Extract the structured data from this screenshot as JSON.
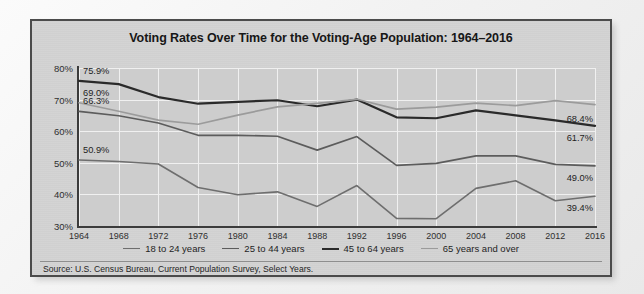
{
  "card": {
    "title": "Voting Rates Over Time for the Voting-Age Population: 1964–2016",
    "source": "Source: U.S. Census Bureau, Current Population Survey, Select Years.",
    "border_color": "#4b4b4b",
    "background_color": "#d2d2d2",
    "plot_background_color": "#cdcdcd",
    "gridline_color": "#f0f0f0"
  },
  "chart_data": {
    "type": "line",
    "title": "Voting Rates Over Time for the Voting-Age Population: 1964–2016",
    "xlabel": "",
    "ylabel": "",
    "ylim": [
      30,
      80
    ],
    "yticks": [
      "30%",
      "40%",
      "50%",
      "60%",
      "70%",
      "80%"
    ],
    "ytick_values": [
      30,
      40,
      50,
      60,
      70,
      80
    ],
    "grid": true,
    "legend_position": "bottom",
    "x": [
      1964,
      1968,
      1972,
      1976,
      1980,
      1984,
      1988,
      1992,
      1996,
      2000,
      2004,
      2008,
      2012,
      2016
    ],
    "categories": [
      "1964",
      "1968",
      "1972",
      "1976",
      "1980",
      "1984",
      "1988",
      "1992",
      "1996",
      "2000",
      "2004",
      "2008",
      "2012",
      "2016"
    ],
    "series": [
      {
        "name": "18 to 24 years",
        "color": "#6e6e6e",
        "width": 1.6,
        "values": [
          50.9,
          50.4,
          49.6,
          42.2,
          39.9,
          40.8,
          36.2,
          42.8,
          32.4,
          32.3,
          41.9,
          44.3,
          38.0,
          39.4
        ],
        "start_label": "50.9%",
        "end_label": "39.4%"
      },
      {
        "name": "25 to 44 years",
        "color": "#5c5c5c",
        "width": 1.7,
        "values": [
          66.3,
          64.9,
          62.6,
          58.7,
          58.7,
          58.4,
          54.0,
          58.3,
          49.2,
          49.8,
          52.2,
          52.2,
          49.5,
          49.0
        ],
        "start_label": "66.3%",
        "end_label": "49.0%"
      },
      {
        "name": "45 to 64 years",
        "color": "#2a2a2a",
        "width": 2.2,
        "values": [
          75.9,
          74.9,
          70.8,
          68.7,
          69.3,
          69.8,
          67.9,
          70.0,
          64.4,
          64.1,
          66.6,
          65.0,
          63.4,
          61.7
        ],
        "start_label": "75.9%",
        "end_label": "61.7%"
      },
      {
        "name": "65 years and over",
        "color": "#9b9b9b",
        "width": 1.7,
        "values": [
          69.0,
          66.3,
          63.5,
          62.2,
          65.1,
          67.7,
          68.8,
          70.1,
          67.0,
          67.6,
          68.9,
          68.1,
          69.7,
          68.4
        ],
        "start_label": "69.0%",
        "end_label": "68.4%"
      }
    ],
    "point_labels": {
      "left": [
        "75.9%",
        "69.0%",
        "66.3%",
        "50.9%"
      ],
      "right": [
        "68.4%",
        "61.7%",
        "49.0%",
        "39.4%"
      ]
    }
  },
  "legend": {
    "items": [
      {
        "label": "18 to 24 years",
        "color": "#6e6e6e"
      },
      {
        "label": "25 to 44 years",
        "color": "#5c5c5c"
      },
      {
        "label": "45 to 64 years",
        "color": "#2a2a2a"
      },
      {
        "label": "65 years and over",
        "color": "#9b9b9b"
      }
    ]
  }
}
